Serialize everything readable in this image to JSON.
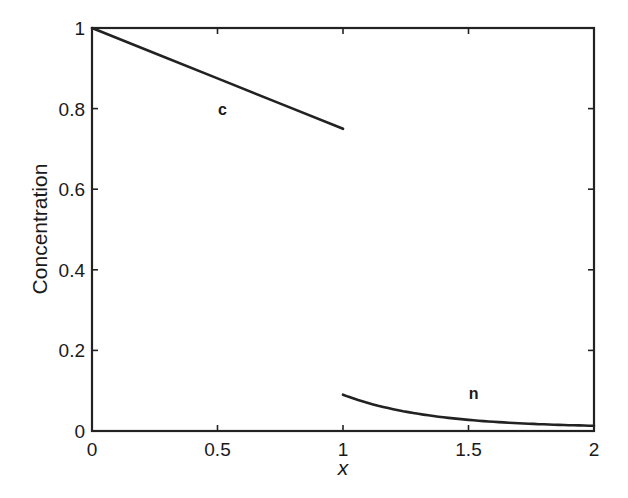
{
  "chart_data": {
    "type": "line",
    "title": "",
    "xlabel": "x",
    "ylabel": "Concentration",
    "xlim": [
      0,
      2
    ],
    "ylim": [
      0,
      1
    ],
    "grid": false,
    "legend": "none (inline curve labels)",
    "x_ticks": [
      0,
      0.5,
      1,
      1.5,
      2
    ],
    "x_tick_labels": [
      "0",
      "0.5",
      "1",
      "1.5",
      "2"
    ],
    "y_ticks": [
      0,
      0.2,
      0.4,
      0.6,
      0.8,
      1
    ],
    "y_tick_labels": [
      "0",
      "0.2",
      "0.4",
      "0.6",
      "0.8",
      "1"
    ],
    "series": [
      {
        "name": "c",
        "label_position": {
          "x": 0.52,
          "y": 0.8
        },
        "x": [
          0,
          0.25,
          0.5,
          0.75,
          1.0
        ],
        "values": [
          1.0,
          0.9375,
          0.875,
          0.8125,
          0.75
        ]
      },
      {
        "name": "n",
        "label_position": {
          "x": 1.52,
          "y": 0.095
        },
        "x": [
          1.0,
          1.125,
          1.25,
          1.375,
          1.5,
          1.625,
          1.75,
          1.875,
          2.0
        ],
        "values": [
          0.09,
          0.068,
          0.052,
          0.037,
          0.026,
          0.019,
          0.015,
          0.012,
          0.01
        ]
      }
    ],
    "colors": {
      "line": "#222222",
      "axes": "#222222",
      "background": "#ffffff"
    }
  }
}
